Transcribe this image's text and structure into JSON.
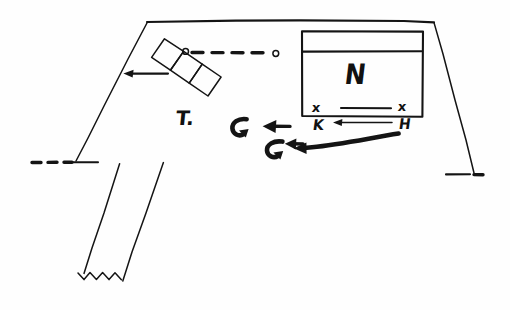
{
  "document": {
    "kind": "hand-drawn-sketch",
    "title": "Hand-drawn site plan sketch",
    "background_color": "#fefefe",
    "ink_color": "#141414",
    "width": 510,
    "height": 310
  },
  "labels": {
    "building_label": "N",
    "tree_label": "T.",
    "mark_top_left": "x",
    "mark_top_right": "x",
    "mark_bottom_left": "K",
    "mark_bottom_right": "H",
    "node_left": "o",
    "node_right": "o"
  },
  "shapes": {
    "top_boundary": "solid horizontal line across top",
    "left_boundary": "solid diagonal line descending left",
    "right_boundary": "solid diagonal line descending right",
    "building_rect": "rectangle with inner divider line",
    "rotated_boxes": "three rotated squares in a diagonal chain",
    "corridor_strip": "diagonal parallel strip with zigzag break",
    "dashed_connector": "dashed line with circle nodes at both ends",
    "left_edge_dashes": "dashed line continuing left boundary",
    "right_edge_dashes": "dashed line continuing right boundary"
  },
  "arrows": {
    "arrow_to_boxes": "left-pointing arrow toward left boundary",
    "arrow_upper_middle": "left-pointing straight arrow",
    "arrow_lower_middle": "left-pointing straight arrow",
    "hook_upper": "curved hook arrow",
    "hook_lower": "curved hook arrow",
    "sweep_arrow": "thick curved sweeping arrow to the left",
    "line_upper_pair": "horizontal rule between x marks",
    "line_lower_pair": "horizontal arrow between K and H"
  }
}
